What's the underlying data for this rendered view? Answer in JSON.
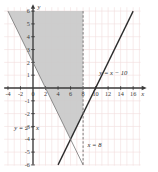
{
  "chart_data": {
    "type": "line",
    "title": "",
    "xlabel": "x",
    "ylabel": "y",
    "xlim": [
      -5,
      17.5
    ],
    "ylim": [
      -6.6,
      6.6
    ],
    "grid": true,
    "grid_step": 1,
    "grid_color": "#f2dede",
    "axis_color": "#3a3a3a",
    "background": "#ffffff",
    "shade_color": "#c9c9c9",
    "legend": "none",
    "xticks": [
      -4,
      -2,
      0,
      2,
      4,
      6,
      8,
      10,
      12,
      14,
      16
    ],
    "xtick_labels": [
      "-4",
      "-2",
      "0",
      "2",
      "4",
      "6",
      "8",
      "10",
      "12",
      "14",
      "16"
    ],
    "yticks": [
      6,
      5,
      4,
      3,
      2,
      1,
      -1,
      -2,
      -3,
      -4,
      -5,
      -6
    ],
    "ytick_labels": [
      "6",
      "5",
      "4",
      "3",
      "2",
      "1",
      "-1",
      "-2",
      "-3",
      "-4",
      "-5",
      "-6"
    ],
    "series": [
      {
        "name": "y = x - 10",
        "label": "y = x − 10",
        "style": "solid",
        "color": "#2b2b2b",
        "slope": 1,
        "intercept": -10,
        "x": [
          4,
          16
        ],
        "y": [
          -6,
          6
        ]
      },
      {
        "name": "y = 2 - x",
        "label": "y = 2 − x",
        "style": "solid-thin",
        "color": "#6e6e6e",
        "slope": -1,
        "intercept": 2,
        "x": [
          -4,
          8
        ],
        "y": [
          6,
          -6
        ]
      },
      {
        "name": "x = 8",
        "label": "x = 8",
        "style": "dashed",
        "color": "#6e6e6e",
        "vertical_at": 8,
        "x": [
          8,
          8
        ],
        "y": [
          6,
          -6
        ]
      }
    ],
    "shaded_region": {
      "description": "region bounded left by y = 2 - x, right by x = 8, lower-right by y = x - 10",
      "vertices": [
        [
          -4,
          6
        ],
        [
          8,
          6
        ],
        [
          8,
          -2
        ],
        [
          6,
          -4
        ]
      ]
    },
    "annotations": [
      {
        "text": "y = x − 10",
        "x": 10.6,
        "y": 1.0
      },
      {
        "text": "y = 2 − x",
        "x": -3.0,
        "y": -3.3
      },
      {
        "text": "x = 8",
        "x": 8.7,
        "y": -4.6
      }
    ]
  },
  "axes": {
    "x_axis_label": "x",
    "y_axis_label": "y"
  }
}
